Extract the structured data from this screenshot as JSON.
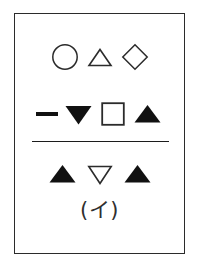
{
  "figure": {
    "label": "(イ)",
    "border_color": "#2b2b2b",
    "background_color": "#ffffff",
    "ink_color": "#111111",
    "divider": {
      "present": true,
      "color": "#1c1c1c"
    },
    "rows": [
      {
        "row_label": "row-1",
        "symbols": [
          {
            "name": "circle-outline",
            "shape": "circle",
            "fill": "none",
            "stroke": "#2b2b2b"
          },
          {
            "name": "triangle-up-outline",
            "shape": "triangle-up",
            "fill": "none",
            "stroke": "#2b2b2b"
          },
          {
            "name": "diamond-outline",
            "shape": "diamond",
            "fill": "none",
            "stroke": "#2b2b2b"
          }
        ]
      },
      {
        "row_label": "row-2",
        "symbols": [
          {
            "name": "dash-mark",
            "shape": "dash",
            "fill": "#111111",
            "stroke": "none"
          },
          {
            "name": "triangle-down-filled",
            "shape": "triangle-down",
            "fill": "#111111",
            "stroke": "none"
          },
          {
            "name": "square-outline",
            "shape": "square",
            "fill": "none",
            "stroke": "#2b2b2b"
          },
          {
            "name": "triangle-up-filled",
            "shape": "triangle-up",
            "fill": "#111111",
            "stroke": "none"
          }
        ]
      },
      {
        "row_label": "row-3",
        "symbols": [
          {
            "name": "triangle-up-filled",
            "shape": "triangle-up",
            "fill": "#111111",
            "stroke": "none"
          },
          {
            "name": "triangle-down-outline",
            "shape": "triangle-down",
            "fill": "none",
            "stroke": "#2b2b2b"
          },
          {
            "name": "triangle-up-filled",
            "shape": "triangle-up",
            "fill": "#111111",
            "stroke": "none"
          }
        ]
      }
    ]
  }
}
